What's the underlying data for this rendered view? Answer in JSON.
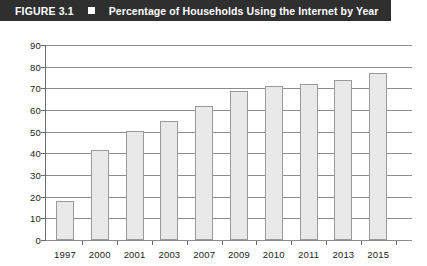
{
  "figure": {
    "label": "FIGURE 3.1",
    "bullet_icon": "square-bullet-icon",
    "caption": "Percentage of Households Using the Internet by Year",
    "titlebar_color": "#2f2f2f",
    "titlebar_text_color": "#ffffff"
  },
  "chart_data": {
    "type": "bar",
    "title": "Percentage of Households Using the Internet by Year",
    "xlabel": "",
    "ylabel": "",
    "categories": [
      "1997",
      "2000",
      "2001",
      "2003",
      "2007",
      "2009",
      "2010",
      "2011",
      "2013",
      "2015"
    ],
    "values": [
      18,
      41.5,
      50.5,
      55,
      62,
      69,
      71,
      72,
      74,
      77
    ],
    "ylim": [
      0,
      90
    ],
    "ytick_step": 10,
    "yticks": [
      "90",
      "80",
      "70",
      "60",
      "50",
      "40",
      "30",
      "20",
      "10",
      "0"
    ],
    "grid": true,
    "grid_orientation": "horizontal",
    "legend": null,
    "bar_fill_color": "#e9e9e9",
    "bar_border_color": "#9a9a9a",
    "gridline_color": "#8c8c8c",
    "axis_color": "#6b6b6b"
  }
}
